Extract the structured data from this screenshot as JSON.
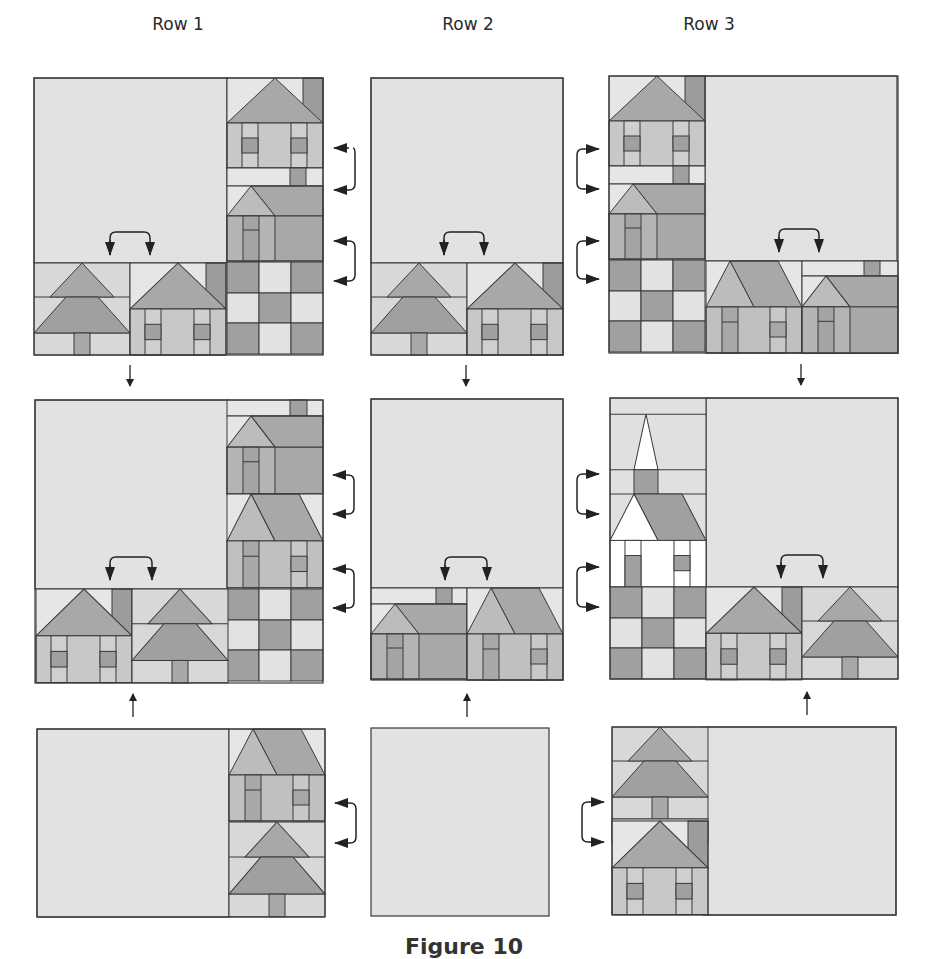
{
  "figure": {
    "column_titles": [
      "Row 1",
      "Row 2",
      "Row 3"
    ],
    "caption": "Figure 10",
    "colors": {
      "sky": "#e2e2e2",
      "light": "#d8d8d8",
      "pale": "#e6e6e6",
      "medium": "#bcbcbc",
      "roof": "#a8a8a8",
      "dark": "#9c9c9c",
      "white": "#ffffff",
      "outline": "#3a3a3a",
      "arrow": "#222222"
    },
    "panels": [
      {
        "id": "r1-top",
        "column": 1,
        "position": "top",
        "blocks": [
          "house-chimney",
          "house-small-roof",
          "nine-patch",
          "tree",
          "house-chimney"
        ],
        "swap_arrows": 3
      },
      {
        "id": "r2-top",
        "column": 2,
        "position": "top",
        "blocks": [
          "tree",
          "house-chimney"
        ],
        "swap_arrows": 1
      },
      {
        "id": "r3-top",
        "column": 3,
        "position": "top",
        "blocks": [
          "house-chimney",
          "house-small-roof",
          "nine-patch",
          "house-wide-roof",
          "house-small-roof"
        ],
        "swap_arrows": 1
      },
      {
        "id": "r1-mid",
        "column": 1,
        "position": "middle",
        "blocks": [
          "house-small-roof",
          "house-wide-roof",
          "nine-patch",
          "house-chimney",
          "tree"
        ],
        "swap_arrows": 3
      },
      {
        "id": "r2-mid",
        "column": 2,
        "position": "middle",
        "blocks": [
          "house-small-roof",
          "house-wide-roof"
        ],
        "swap_arrows": 1
      },
      {
        "id": "r3-mid",
        "column": 3,
        "position": "middle",
        "blocks": [
          "church",
          "nine-patch",
          "house-chimney",
          "tree"
        ],
        "swap_arrows": 1
      },
      {
        "id": "r1-bot",
        "column": 1,
        "position": "bottom",
        "blocks": [
          "house-wide-roof",
          "tree"
        ],
        "swap_arrows": 1
      },
      {
        "id": "r2-bot",
        "column": 2,
        "position": "bottom",
        "blocks": [],
        "swap_arrows": 0
      },
      {
        "id": "r3-bot",
        "column": 3,
        "position": "bottom",
        "blocks": [
          "tree",
          "house-chimney"
        ],
        "swap_arrows": 1
      }
    ]
  }
}
